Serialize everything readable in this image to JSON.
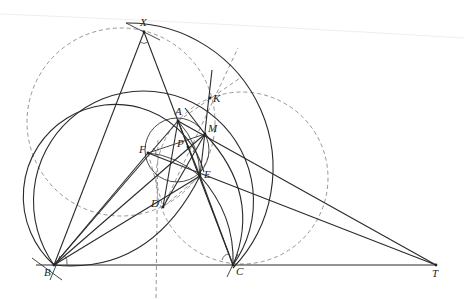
{
  "figure": {
    "type": "geometry-construction",
    "points": [
      {
        "name": "X",
        "x": 144,
        "y": 32,
        "label_dx": -4,
        "label_dy": -6
      },
      {
        "name": "A",
        "x": 178,
        "y": 121,
        "label_dx": -3,
        "label_dy": -6
      },
      {
        "name": "K",
        "x": 210,
        "y": 98,
        "label_dx": 3,
        "label_dy": 4
      },
      {
        "name": "M",
        "x": 205,
        "y": 134,
        "label_dx": 3,
        "label_dy": -2
      },
      {
        "name": "P",
        "x": 188,
        "y": 147,
        "label_dx": -11,
        "label_dy": 0
      },
      {
        "name": "F",
        "x": 148,
        "y": 153,
        "label_dx": -9,
        "label_dy": 0
      },
      {
        "name": "E",
        "x": 200,
        "y": 176,
        "label_dx": 4,
        "label_dy": 2
      },
      {
        "name": "D",
        "x": 163,
        "y": 207,
        "label_dx": -12,
        "label_dy": 0
      },
      {
        "name": "B",
        "x": 54,
        "y": 265,
        "label_dx": -10,
        "label_dy": 11
      },
      {
        "name": "C",
        "x": 233,
        "y": 265,
        "label_dx": 3,
        "label_dy": 10
      },
      {
        "name": "T",
        "x": 436,
        "y": 265,
        "label_dx": -4,
        "label_dy": 12
      }
    ],
    "labels": {
      "X": "X",
      "A": "A",
      "K": "K",
      "M": "M",
      "P": "P",
      "F": "F",
      "E": "E",
      "D": "D",
      "B": "B",
      "C": "C",
      "T": "T"
    },
    "colors": {
      "solid": "#2a2a2a",
      "dashed": "#8a8a8a",
      "background": "#ffffff"
    }
  }
}
